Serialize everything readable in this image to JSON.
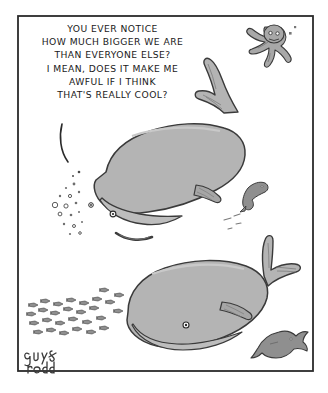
{
  "comic": {
    "title": "New Yorker style single panel cartoon: two large whales talking",
    "signature": "guy&rodd",
    "caption_lines": [
      "YOU EVER NOTICE",
      "HOW MUCH BIGGER WE ARE",
      "THAN EVERYONE ELSE?",
      "I MEAN, DOES IT MAKE ME",
      "AWFUL IF I THINK",
      "THAT'S REALLY COOL?"
    ],
    "caption_full": "YOU EVER NOTICE HOW MUCH BIGGER WE ARE THAN EVERYONE ELSE? I MEAN, DOES IT MAKE ME AWFUL IF I THINK THAT'S REALLY COOL?"
  },
  "colors": {
    "page_background": "#ffffff",
    "panel_background": "#ffffff",
    "panel_border": "#2b2b2b",
    "ink": "#2b2b2b",
    "caption_text": "#1a1a1a",
    "whale_body": "#b4b4b4",
    "whale_body_shade": "#a6a6a6",
    "whale_highlight": "#c6c6c6",
    "creature_fill": "#a8a8a8",
    "fish_fill": "#8f8f8f",
    "eye_white": "#ffffff",
    "mouth_dark": "#3d3d3d"
  },
  "panel": {
    "x": 17,
    "y": 15,
    "width": 296,
    "height": 356,
    "border_width": 2
  },
  "elements": {
    "speech_tail_label": "speech-bubble-pointer",
    "upper_whale_label": "upper-whale",
    "lower_whale_label": "lower-whale",
    "octopus_label": "octopus",
    "bubbles_label": "bubble-cluster",
    "fish_school_label": "fish-school",
    "small_fish_label": "small-fish",
    "large_fish_label": "large-fish"
  }
}
